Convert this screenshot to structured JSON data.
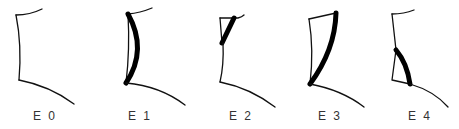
{
  "figure": {
    "title": "",
    "panels": [
      {
        "id": "E0",
        "label": "E 0",
        "highlighted_segment": "none"
      },
      {
        "id": "E1",
        "label": "E 1",
        "highlighted_segment": "full vertical edge (curved)"
      },
      {
        "id": "E2",
        "label": "E 2",
        "highlighted_segment": "upper diagonal"
      },
      {
        "id": "E3",
        "label": "E 3",
        "highlighted_segment": "full long diagonal"
      },
      {
        "id": "E4",
        "label": "E 4",
        "highlighted_segment": "lower diagonal"
      }
    ],
    "colors": {
      "stroke": "#111111",
      "highlight": "#000000",
      "label": "#333333",
      "background": "#ffffff"
    }
  }
}
